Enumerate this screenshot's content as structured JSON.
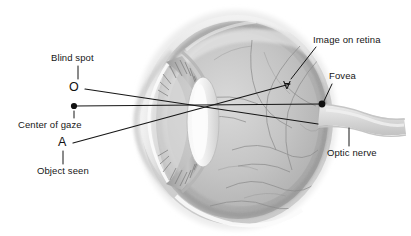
{
  "figure": {
    "background_color": "#ffffff",
    "line_color": "#161616",
    "text_color": "#161616"
  },
  "labels": {
    "blind_spot": "Blind spot",
    "center_of_gaze": "Center of gaze",
    "object_seen": "Object seen",
    "image_on_retina": "Image on retina",
    "fovea": "Fovea",
    "optic_nerve": "Optic nerve"
  },
  "points": {
    "blind_spot_marker": "O",
    "object_marker": "A",
    "retinal_image_marker": "A"
  },
  "anatomy": {
    "parts": [
      "cornea",
      "lens",
      "iris",
      "ciliary-body",
      "sclera",
      "retina",
      "choroid-vessels",
      "optic-nerve",
      "vitreous-humor"
    ],
    "tint_light": "#e8e8e8",
    "tint_mid": "#b8b8b8",
    "tint_dark": "#8f8f8f"
  }
}
